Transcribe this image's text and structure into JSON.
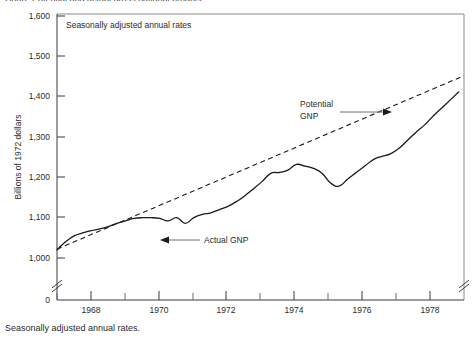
{
  "caption": {
    "bottom_text": "Seasonally adjusted annual rates.",
    "top_cut_text": "Chart: Potential and actual gross national product"
  },
  "chart_data": {
    "type": "line",
    "title": "",
    "xlabel": "",
    "ylabel": "Billions of 1972 dollars",
    "plot_note": "Seasonally adjusted annual rates",
    "xlim": [
      1967.0,
      1978.9
    ],
    "ylim": [
      1000,
      1600
    ],
    "ytick_values": [
      1000,
      1100,
      1200,
      1300,
      1400,
      1500,
      1600
    ],
    "ytick_labels": [
      "1,000",
      "1,100",
      "1,200",
      "1,300",
      "1,400",
      "1,500",
      "1,600"
    ],
    "origin_label": "0",
    "xtick_values": [
      1968,
      1970,
      1972,
      1974,
      1976,
      1978
    ],
    "xtick_labels": [
      "1968",
      "1970",
      "1972",
      "1974",
      "1976",
      "1978"
    ],
    "xtick_minor_values": [
      1967,
      1969,
      1971,
      1973,
      1975,
      1977
    ],
    "axis_break": true,
    "grid": false,
    "legend": "annotations",
    "series": [
      {
        "name": "Actual GNP",
        "style": "solid",
        "color": "#1a1a1a",
        "annotation": "Actual GNP",
        "x": [
          1967.0,
          1967.25,
          1967.5,
          1967.75,
          1968.0,
          1968.25,
          1968.5,
          1968.75,
          1969.0,
          1969.25,
          1969.5,
          1969.75,
          1970.0,
          1970.25,
          1970.5,
          1970.75,
          1971.0,
          1971.25,
          1971.5,
          1971.75,
          1972.0,
          1972.25,
          1972.5,
          1972.75,
          1973.0,
          1973.25,
          1973.5,
          1973.75,
          1974.0,
          1974.25,
          1974.5,
          1974.75,
          1975.0,
          1975.25,
          1975.5,
          1975.75,
          1976.0,
          1976.25,
          1976.5,
          1976.75,
          1977.0,
          1977.25,
          1977.5,
          1977.75,
          1978.0,
          1978.25,
          1978.5,
          1978.75
        ],
        "y": [
          1020,
          1040,
          1055,
          1062,
          1068,
          1072,
          1078,
          1086,
          1092,
          1098,
          1100,
          1100,
          1098,
          1092,
          1100,
          1086,
          1100,
          1108,
          1112,
          1120,
          1128,
          1140,
          1155,
          1172,
          1190,
          1210,
          1212,
          1218,
          1232,
          1228,
          1222,
          1210,
          1186,
          1178,
          1196,
          1212,
          1228,
          1244,
          1252,
          1258,
          1272,
          1292,
          1312,
          1330,
          1352,
          1372,
          1392,
          1412
        ]
      },
      {
        "name": "Potential GNP",
        "style": "dashed",
        "color": "#1a1a1a",
        "annotation": "Potential GNP",
        "x": [
          1967.0,
          1978.9
        ],
        "y": [
          1022,
          1452
        ]
      }
    ],
    "annotations": [
      {
        "label": "Potential GNP",
        "lines": [
          "Potential",
          "GNP"
        ],
        "arrow": "right",
        "text_x": 300,
        "text_y": 104,
        "target_x": 389,
        "target_y": 112
      },
      {
        "label": "Actual GNP",
        "lines": [
          "Actual GNP"
        ],
        "arrow": "left",
        "text_x": 200,
        "text_y": 240,
        "target_x": 160,
        "target_y": 240
      }
    ]
  }
}
